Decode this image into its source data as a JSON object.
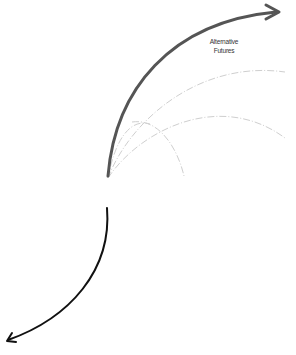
{
  "diagram": {
    "label_line1": "Alternative",
    "label_line2": "Futures",
    "colors": {
      "future_arrow": "#555555",
      "past_arrow": "#111111",
      "alternative_paths": "#c8c8c8"
    }
  }
}
